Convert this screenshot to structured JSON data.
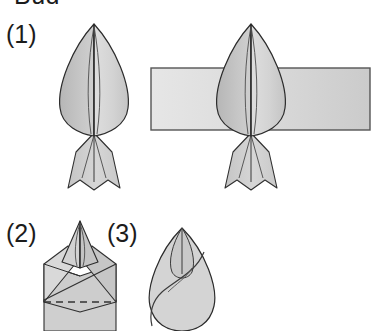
{
  "figure": {
    "caption_top": "Bud",
    "caption_top_note": "partially cropped at the top edge of the image",
    "background_color": "#ffffff",
    "panels": [
      {
        "label": "(1)",
        "name": "panel-1-unfolded-bud-and-band"
      },
      {
        "label": "(2)",
        "name": "panel-2-faceted-folded-bud"
      },
      {
        "label": "(3)",
        "name": "panel-3-spiral-closed-bud"
      }
    ],
    "palette": {
      "outline": "#2b2b2b",
      "crease": "#3a3a3a",
      "fill_left_lobe": "#c2c2c2",
      "fill_right_lobe": "#d7d7d7",
      "fill_tail": "#d2d2d2",
      "band_fill_light": "#e3e3e3",
      "band_fill_dark": "#cfcfcf",
      "band_border": "#555555",
      "facet_light": "#dadada",
      "facet_mid": "#c9c9c9",
      "facet_dark": "#bdbdbd",
      "dashed_crease": "#333333"
    },
    "elements": {
      "bud_left": "bud-shape-left",
      "bud_right": "bud-shape-over-band",
      "horizontal_band": "horizontal-band-rectangle",
      "tail_notched": "notched-tail",
      "dashed_fold_line": "dashed-fold-line",
      "spiral_crease": "spiral-crease-curve"
    }
  }
}
